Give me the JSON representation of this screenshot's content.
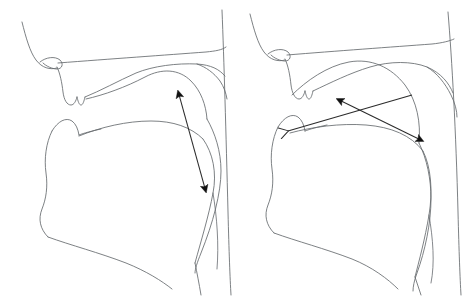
{
  "figure": {
    "background_color": "#ffffff",
    "line_color": "#666a6e",
    "arrow_color": "#2b2b2b",
    "width": 473,
    "height": 301,
    "panel_count": 2
  },
  "panels": [
    {
      "id": "left-panel",
      "name": "left-vocal-tract-diagram",
      "caption": "",
      "arrow_count": 1,
      "arrows": [
        {
          "id": "left-arrow-1",
          "name": "tongue-body-movement-arrow",
          "style": "double-headed",
          "head_start": "solid",
          "head_end": "solid",
          "from": [
            178,
            91
          ],
          "to": [
            206,
            192
          ],
          "label": ""
        }
      ],
      "outline_paths": {
        "nose_bridge": "M 22,22 C 26,38 30,52 36,60 C 42,68 50,70 57,68",
        "nostril": "M 40,62 C 46,57 55,56 60,60 C 64,64 62,69 57,69 C 52,69 46,66 43,63",
        "upper_lip": "M 57,66 C 60,72 62,82 63,92 C 64,100 67,104 71,104 C 74,104 76,100 77,96",
        "lip_notch": "M 77,96 C 78,100 79,104 81,104 C 83,104 84,100 85,96",
        "hard_palate": "M 60,62 C 110,58 165,55 206,52 C 216,51 222,50 226,48",
        "palate_inner": "M 85,96 C 100,90 118,80 135,72 C 152,65 176,62 196,63 C 210,64 218,68 224,74",
        "velum": "M 196,63 C 206,66 214,72 220,80 C 224,86 226,92 227,98",
        "tongue_upper": "M 86,98 C 104,94 126,86 145,76 C 162,67 178,68 190,80 C 200,90 205,104 206,118",
        "back_pharynx_wall": "M 222,12 C 224,60 226,130 228,210 C 229,250 230,276 231,292",
        "jaw_upper": "M 52,130 C 58,120 66,116 72,120 C 76,123 78,128 79,134",
        "jaw_chin": "M 52,130 C 46,142 44,158 46,172 C 48,186 46,198 42,208 C 38,218 40,228 48,236",
        "lower_lip": "M 79,134 C 84,132 92,130 102,128",
        "tongue_front": "M 79,134 C 100,126 126,120 150,120 C 172,120 190,126 202,138",
        "tongue_body": "M 202,138 C 212,152 216,172 212,192 C 208,214 200,240 194,262",
        "tongue_root": "M 206,118 C 214,132 220,150 220,170 C 220,192 212,222 200,252 C 196,262 194,268 194,272",
        "jaw_lower": "M 48,236 C 70,244 100,252 126,262 C 146,270 162,280 172,288",
        "larynx_front": "M 194,262 C 196,272 198,282 200,292",
        "larynx_back": "M 212,192 C 216,216 218,244 216,268"
      }
    },
    {
      "id": "right-panel",
      "name": "right-vocal-tract-diagram",
      "caption": "",
      "arrow_count": 2,
      "arrows": [
        {
          "id": "right-arrow-1",
          "name": "tongue-body-raising-arrow",
          "style": "double-headed",
          "head_start": "solid",
          "head_end": "solid",
          "from": [
            337,
            99
          ],
          "to": [
            423,
            141
          ],
          "label": ""
        },
        {
          "id": "right-arrow-2",
          "name": "tongue-fronting-arrow",
          "style": "single-headed-open",
          "head_start": "open",
          "head_end": "none",
          "from": [
            412,
            95
          ],
          "to": [
            288,
            131
          ],
          "label": ""
        }
      ],
      "outline_paths": {
        "nose_bridge": "M 250,16 C 254,32 258,46 264,54 C 270,62 278,64 285,62",
        "nostril": "M 268,56 C 274,51 283,50 288,54 C 292,58 290,63 285,63 C 280,63 274,60 271,57",
        "upper_lip": "M 285,60 C 288,66 290,76 291,86 C 292,94 295,98 299,98 C 302,98 304,94 305,90",
        "lip_notch": "M 305,90 C 306,94 307,98 309,98 C 311,98 312,94 313,90",
        "hard_palate": "M 288,56 C 336,52 392,48 432,45 C 442,44 450,42 454,40",
        "palate_inner": "M 313,90 C 330,82 350,72 370,66 C 390,60 412,60 426,66 C 440,72 448,82 452,92",
        "velum": "M 426,66 C 436,72 444,82 450,94 C 454,102 456,110 456,116",
        "tongue_upper": "M 292,94 C 306,80 326,66 348,62 C 370,58 390,66 404,84 C 416,100 420,122 418,142",
        "back_pharynx_wall": "M 448,14 C 452,60 456,130 458,210 C 459,250 460,276 461,292",
        "jaw_upper": "M 278,126 C 284,116 292,112 298,116 C 302,119 304,124 305,130",
        "jaw_chin": "M 278,126 C 272,138 270,154 272,168 C 274,182 272,194 268,204 C 264,214 266,224 274,232",
        "lower_lip": "M 305,130 C 310,128 318,126 328,124",
        "tongue_front": "M 290,132 C 312,126 340,122 366,124 C 390,126 410,134 422,150",
        "tongue_body": "M 422,150 C 430,166 432,190 428,214 C 424,238 418,260 414,276",
        "tongue_root": "M 418,142 C 426,158 430,178 430,198 C 430,222 424,250 416,272 C 413,280 412,286 412,290",
        "jaw_lower": "M 274,232 C 296,240 326,248 352,258 C 372,266 388,278 398,288",
        "larynx_front": "M 414,276 C 416,282 418,288 420,292",
        "larynx_back": "M 428,214 C 432,238 434,262 430,280"
      }
    }
  ]
}
